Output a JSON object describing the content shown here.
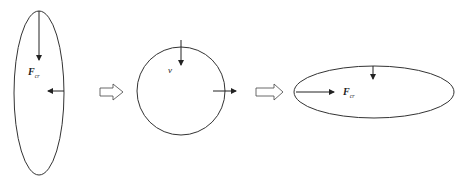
{
  "diagram": {
    "stages": [
      {
        "id": "vertical-ellipse",
        "label_main": "F",
        "label_sub": "cr"
      },
      {
        "id": "circle",
        "label_main": "v",
        "label_sub": ""
      },
      {
        "id": "horizontal-ellipse",
        "label_main": "F",
        "label_sub": "cr"
      }
    ],
    "transitions": [
      "hollow-right-arrow",
      "hollow-right-arrow"
    ],
    "colors": {
      "stroke": "#333333",
      "background": "#ffffff"
    }
  }
}
